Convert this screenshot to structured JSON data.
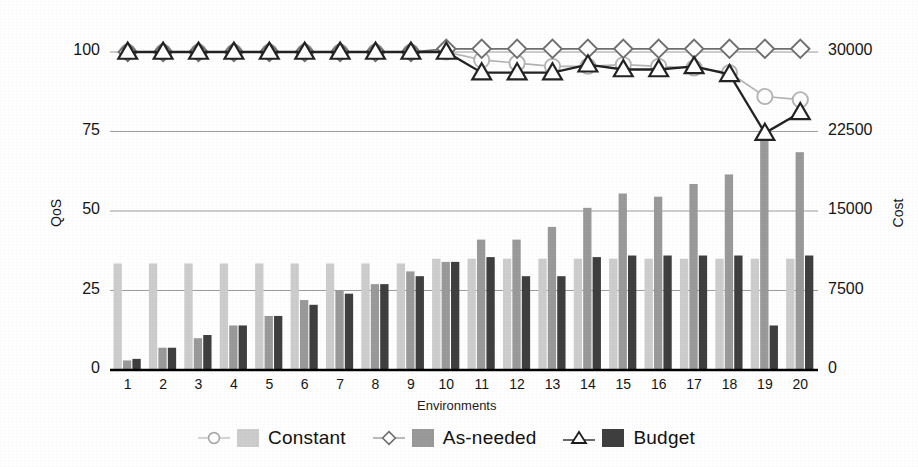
{
  "chart_data": {
    "type": "bar",
    "title": "",
    "xlabel": "Environments",
    "ylabel": "QoS",
    "y2label": "Cost",
    "categories": [
      "1",
      "2",
      "3",
      "4",
      "5",
      "6",
      "7",
      "8",
      "9",
      "10",
      "11",
      "12",
      "13",
      "14",
      "15",
      "16",
      "17",
      "18",
      "19",
      "20"
    ],
    "ylim": [
      0,
      106
    ],
    "ylim_right": [
      0,
      31800
    ],
    "yticks": [
      "0",
      "25",
      "50",
      "75",
      "100"
    ],
    "ytick_values": [
      0,
      25,
      50,
      75,
      100
    ],
    "yticks_right": [
      "0",
      "7500",
      "15000",
      "22500",
      "30000"
    ],
    "ytick_values_right": [
      0,
      7500,
      15000,
      22500,
      30000
    ],
    "grid": true,
    "legend_position": "bottom",
    "bar_series": [
      {
        "name": "Constant",
        "axis": "right",
        "color": "#cdcdcd",
        "values_cost": [
          10050,
          10050,
          10050,
          10050,
          10050,
          10050,
          10050,
          10050,
          10050,
          10500,
          10500,
          10500,
          10500,
          10500,
          10500,
          10500,
          10500,
          10500,
          10500,
          10500
        ],
        "values": [
          33.5,
          33.5,
          33.5,
          33.5,
          33.5,
          33.5,
          33.5,
          33.5,
          33.5,
          35,
          35,
          35,
          35,
          35,
          35,
          35,
          35,
          35,
          35,
          35
        ]
      },
      {
        "name": "As-needed",
        "axis": "right",
        "color": "#9a9a9a",
        "values_cost": [
          900,
          2100,
          3000,
          4200,
          5100,
          6600,
          7500,
          8100,
          9300,
          10200,
          12300,
          12300,
          13500,
          15300,
          16650,
          16350,
          17550,
          18450,
          21600,
          20550
        ],
        "values": [
          3,
          7,
          10,
          14,
          17,
          22,
          25,
          27,
          31,
          34,
          41,
          41,
          45,
          51,
          55.5,
          54.5,
          58.5,
          61.5,
          72,
          68.5
        ]
      },
      {
        "name": "Budget",
        "axis": "right",
        "color": "#3f3f3f",
        "values_cost": [
          1050,
          2100,
          3300,
          4200,
          5100,
          6150,
          7200,
          8100,
          8850,
          10200,
          10650,
          8850,
          8850,
          10650,
          10800,
          10800,
          10800,
          10800,
          4200,
          10800
        ],
        "values": [
          3.5,
          7,
          11,
          14,
          17,
          20.5,
          24,
          27,
          29.5,
          34,
          35.5,
          29.5,
          29.5,
          35.5,
          36,
          36,
          36,
          36,
          14,
          36
        ]
      }
    ],
    "line_series": [
      {
        "name": "Constant",
        "axis": "left",
        "marker": "circle",
        "color": "#b4b4b4",
        "values": [
          100,
          100,
          100,
          100,
          100,
          100,
          100,
          100,
          100,
          100,
          97.5,
          96.5,
          95.5,
          95.5,
          96,
          95.5,
          95,
          93.5,
          86,
          85
        ]
      },
      {
        "name": "As-needed",
        "axis": "left",
        "marker": "diamond",
        "color": "#6f6f6f",
        "values": [
          100,
          100,
          100,
          100,
          100,
          100,
          100,
          100,
          100,
          101,
          101,
          101,
          101,
          101,
          101,
          101,
          101,
          101,
          101,
          101
        ]
      },
      {
        "name": "Budget",
        "axis": "left",
        "marker": "triangle",
        "color": "#232323",
        "values": [
          100,
          100,
          100,
          100,
          100,
          100,
          100,
          100,
          100,
          100,
          93.5,
          93.5,
          93.5,
          96,
          94.5,
          94.5,
          95.5,
          93,
          74.5,
          81
        ]
      }
    ]
  },
  "legend": {
    "items": [
      {
        "marker": "circle-marker",
        "swatch": "constant-swatch",
        "label": "Constant"
      },
      {
        "marker": "diamond-marker",
        "swatch": "as-needed-swatch",
        "label": "As-needed"
      },
      {
        "marker": "triangle-marker",
        "swatch": "budget-swatch",
        "label": "Budget"
      }
    ]
  },
  "colors": {
    "constant_bar": "#cdcdcd",
    "asneeded_bar": "#9a9a9a",
    "budget_bar": "#3f3f3f",
    "constant_line": "#b4b4b4",
    "asneeded_line": "#6f6f6f",
    "budget_line": "#232323",
    "grid": "#8d8d8d",
    "axis": "#000000"
  }
}
